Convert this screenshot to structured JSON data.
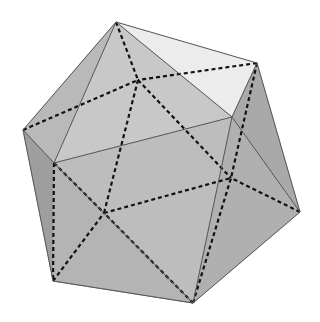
{
  "figure": {
    "background": "#ffffff",
    "edge_color": "#555555",
    "hidden_edge_color": "#111111",
    "vertices": {
      "top": [
        116,
        22
      ],
      "upper_right": [
        257,
        63
      ],
      "left": [
        23,
        130
      ],
      "front_left": [
        54,
        163
      ],
      "front_right": [
        232,
        117
      ],
      "right": [
        300,
        212
      ],
      "bottom": [
        193,
        303
      ],
      "lower_left": [
        53,
        281
      ],
      "back_top": [
        138,
        80
      ],
      "back_right": [
        231,
        178
      ],
      "back_left": [
        104,
        213
      ]
    },
    "faces": [
      {
        "pts": [
          "top",
          "front_right",
          "upper_right"
        ],
        "fill": "#ececec"
      },
      {
        "pts": [
          "top",
          "left",
          "front_left"
        ],
        "fill": "#b9b9b9"
      },
      {
        "pts": [
          "top",
          "front_left",
          "front_right"
        ],
        "fill": "#c8c8c8"
      },
      {
        "pts": [
          "front_right",
          "upper_right",
          "right"
        ],
        "fill": "#a9a9a9"
      },
      {
        "pts": [
          "front_left",
          "front_right",
          "bottom"
        ],
        "fill": "#bdbdbd"
      },
      {
        "pts": [
          "front_right",
          "right",
          "bottom"
        ],
        "fill": "#b0b0b0"
      },
      {
        "pts": [
          "left",
          "front_left",
          "lower_left"
        ],
        "fill": "#9e9e9e"
      },
      {
        "pts": [
          "front_left",
          "lower_left",
          "bottom"
        ],
        "fill": "#b4b4b4"
      },
      {
        "pts": [
          "lower_left",
          "bottom",
          "bottom"
        ],
        "fill": "#999999"
      }
    ],
    "visible_edges": [
      [
        "top",
        "left"
      ],
      [
        "top",
        "upper_right"
      ],
      [
        "top",
        "front_right"
      ],
      [
        "top",
        "front_left"
      ],
      [
        "left",
        "front_left"
      ],
      [
        "front_left",
        "front_right"
      ],
      [
        "front_right",
        "upper_right"
      ],
      [
        "upper_right",
        "right"
      ],
      [
        "front_right",
        "right"
      ],
      [
        "front_right",
        "bottom"
      ],
      [
        "front_left",
        "bottom"
      ],
      [
        "right",
        "bottom"
      ],
      [
        "left",
        "lower_left"
      ],
      [
        "lower_left",
        "bottom"
      ]
    ],
    "hidden_edges": [
      [
        "top",
        "back_top"
      ],
      [
        "left",
        "back_top"
      ],
      [
        "upper_right",
        "back_top"
      ],
      [
        "back_top",
        "back_right"
      ],
      [
        "back_top",
        "back_left"
      ],
      [
        "back_left",
        "back_right"
      ],
      [
        "upper_right",
        "back_right"
      ],
      [
        "right",
        "back_right"
      ],
      [
        "bottom",
        "back_right"
      ],
      [
        "front_left",
        "back_left"
      ],
      [
        "lower_left",
        "back_left"
      ],
      [
        "front_left",
        "lower_left"
      ],
      [
        "bottom",
        "back_left"
      ]
    ]
  }
}
